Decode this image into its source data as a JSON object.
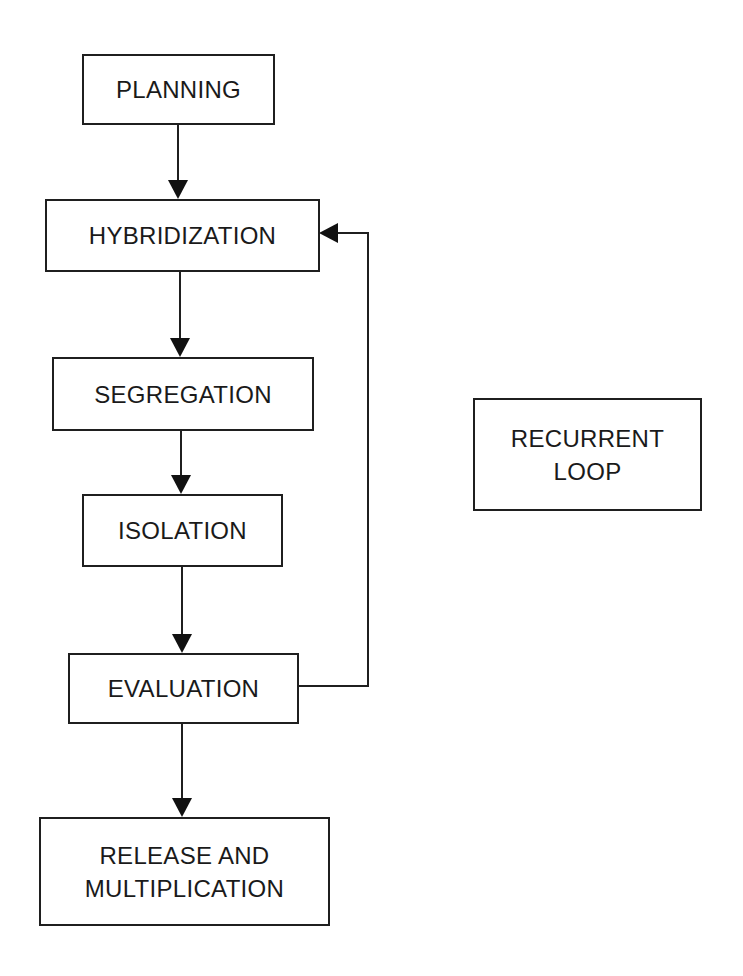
{
  "diagram": {
    "type": "flowchart",
    "nodes": [
      {
        "id": "planning",
        "label": "PLANNING"
      },
      {
        "id": "hybridization",
        "label": "HYBRIDIZATION"
      },
      {
        "id": "segregation",
        "label": "SEGREGATION"
      },
      {
        "id": "isolation",
        "label": "ISOLATION"
      },
      {
        "id": "evaluation",
        "label": "EVALUATION"
      },
      {
        "id": "release",
        "label_line1": "RELEASE AND",
        "label_line2": "MULTIPLICATION"
      },
      {
        "id": "legend",
        "label_line1": "RECURRENT",
        "label_line2": "LOOP"
      }
    ],
    "edges": [
      {
        "from": "planning",
        "to": "hybridization"
      },
      {
        "from": "hybridization",
        "to": "segregation"
      },
      {
        "from": "segregation",
        "to": "isolation"
      },
      {
        "from": "isolation",
        "to": "evaluation"
      },
      {
        "from": "evaluation",
        "to": "release"
      },
      {
        "from": "evaluation",
        "to": "hybridization",
        "type": "recurrent-loop"
      }
    ]
  }
}
